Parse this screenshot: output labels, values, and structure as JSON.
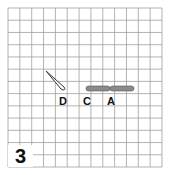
{
  "figure": {
    "panel_number": "3",
    "grid": {
      "columns": 13,
      "rows": 13,
      "line_color": "#9a9a9a"
    },
    "objects": [
      {
        "id": "D",
        "label": "D",
        "shape": "needle",
        "fill": "#ffffff",
        "stroke": "#333333"
      },
      {
        "id": "C",
        "label": "C",
        "shape": "bar-segment",
        "fill": "#8a8a8a"
      },
      {
        "id": "A",
        "label": "A",
        "shape": "bar-segment",
        "fill": "#8a8a8a"
      }
    ]
  }
}
